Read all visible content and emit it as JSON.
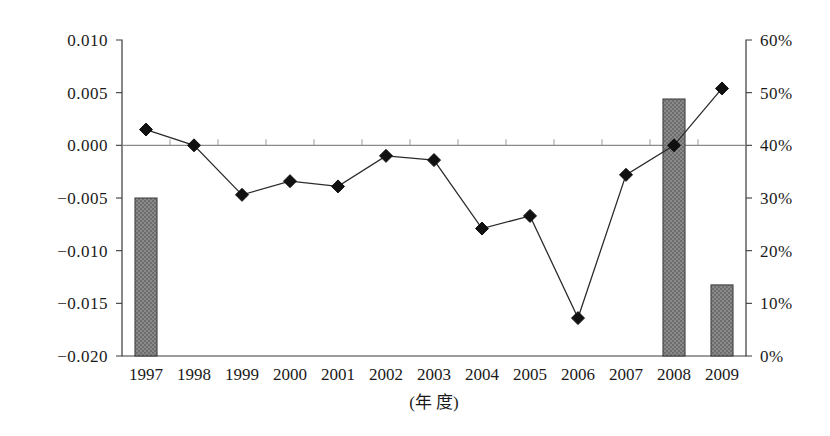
{
  "chart_data": {
    "type": "bar",
    "title": "",
    "subtitle": "",
    "xlabel": "(年  度)",
    "ylabel": "",
    "ylabel_right": "",
    "grid": false,
    "legend_position": "none",
    "categories": [
      "1997",
      "1998",
      "1999",
      "2000",
      "2001",
      "2002",
      "2003",
      "2004",
      "2005",
      "2006",
      "2007",
      "2008",
      "2009"
    ],
    "left_axis": {
      "ticks": [
        "0.010",
        "0.005",
        "0.000",
        "-0.005",
        "-0.010",
        "-0.015",
        "-0.020"
      ],
      "tick_values": [
        0.01,
        0.005,
        0.0,
        -0.005,
        -0.01,
        -0.015,
        -0.02
      ],
      "ylim": [
        -0.02,
        0.01
      ]
    },
    "right_axis": {
      "ticks": [
        "60%",
        "50%",
        "40%",
        "30%",
        "20%",
        "10%",
        "0%"
      ],
      "tick_values": [
        60,
        50,
        40,
        30,
        20,
        10,
        0
      ],
      "ylim": [
        0,
        60
      ]
    },
    "series": [
      {
        "name": "bar-series",
        "type": "bar",
        "axis": "right",
        "unit": "%",
        "values": [
          30.0,
          null,
          null,
          null,
          null,
          null,
          null,
          null,
          null,
          null,
          null,
          48.8,
          13.5
        ]
      },
      {
        "name": "line-series",
        "type": "line",
        "axis": "left",
        "marker": "diamond",
        "values": [
          0.0015,
          0.0,
          -0.0047,
          -0.0034,
          -0.0039,
          -0.001,
          -0.0014,
          -0.0079,
          -0.0067,
          -0.0164,
          -0.0028,
          0.0,
          0.0054
        ]
      }
    ],
    "colors": {
      "bar_fill": "#808080",
      "bar_stroke": "#3a3a3a",
      "line": "#2b2b2b",
      "marker": "#111111",
      "axis": "#3a3a3a",
      "zero_line": "#8a8a8a",
      "background": "#ffffff"
    }
  }
}
